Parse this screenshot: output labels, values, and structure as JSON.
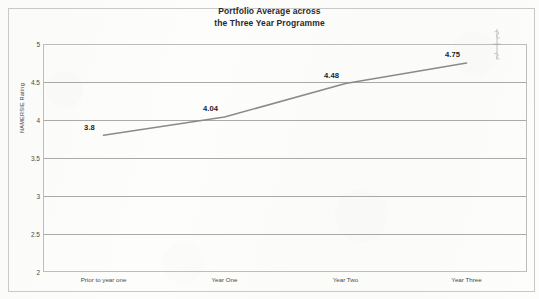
{
  "chart_data": {
    "type": "line",
    "title": "Portfolio Average across the Three Year Programme",
    "title_line_1": "Portfolio Average across",
    "title_line_2": "the Three Year Programme",
    "categories": [
      "Prior to year one",
      "Year One",
      "Year Two",
      "Year Three"
    ],
    "values": [
      3.8,
      4.04,
      4.48,
      4.75
    ],
    "data_labels": [
      "3.8",
      "4.04",
      "4.48",
      "4.75"
    ],
    "series": [
      {
        "name": "Portfolio Average",
        "values": [
          3.8,
          4.04,
          4.48,
          4.75
        ]
      }
    ],
    "xlabel": "",
    "ylabel": "NAMERSIE Rating",
    "ylim": [
      2,
      5
    ],
    "y_ticks": [
      "5",
      "4.5",
      "4",
      "3.5",
      "3",
      "2.5",
      "2"
    ],
    "y_tick_values": [
      5,
      4.5,
      4,
      3.5,
      3,
      2.5,
      2
    ],
    "y_step": 0.5,
    "grid": "horizontal",
    "legend": "none",
    "line_color": "#8a8a8a",
    "gridline_color": "#a9a9a9",
    "plot_border_color": "#bdbdbd",
    "frame_color": "#c9c9c9",
    "background_color": "#fdfdfc",
    "text_color": "#2b2b2b",
    "annotations": [
      {
        "name": "pencil-mark",
        "text": "",
        "description": "faint handwritten pencil mark above the 4.75 data label"
      }
    ]
  }
}
